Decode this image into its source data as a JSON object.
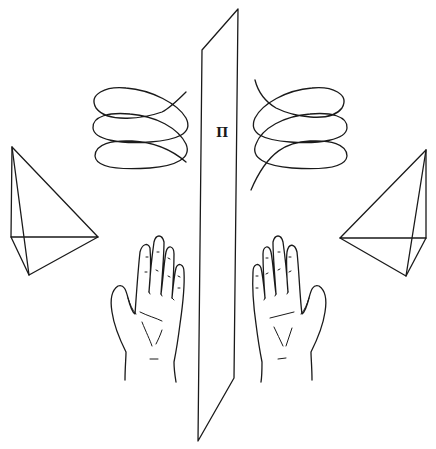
{
  "diagram": {
    "mirror_plane": {
      "label": "Π",
      "corners": [
        [
          238,
          9
        ],
        [
          202,
          50
        ],
        [
          198,
          441
        ],
        [
          234,
          378
        ]
      ]
    },
    "left_side": {
      "helix": "left-handed helix",
      "pyramid": "left tetrahedron",
      "hand": "left hand (palm)"
    },
    "right_side": {
      "helix": "right-handed helix",
      "pyramid": "right tetrahedron",
      "hand": "right hand (palm)"
    },
    "colors": {
      "line": "#1a1a1a",
      "background": "#ffffff"
    }
  }
}
